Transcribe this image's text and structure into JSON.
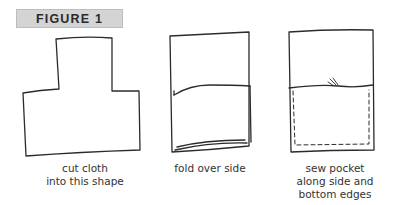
{
  "figure": {
    "label": "FIGURE 1",
    "label_bg": "#d4d4d4",
    "steps": [
      {
        "id": "cut",
        "caption": "cut cloth\ninto this shape",
        "illustration": "t-shaped-cloth"
      },
      {
        "id": "fold",
        "caption": "fold over side",
        "illustration": "rectangle-with-fold"
      },
      {
        "id": "sew",
        "caption": "sew pocket\nalong side and\nbottom edges",
        "illustration": "rectangle-with-stitched-pocket"
      }
    ]
  }
}
